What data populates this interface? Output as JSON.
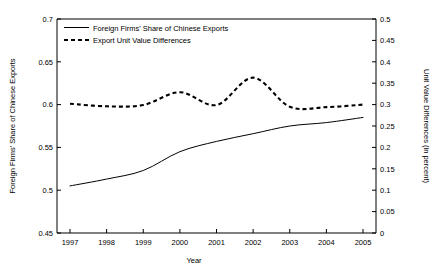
{
  "chart_data": {
    "type": "line",
    "title": "",
    "xlabel": "Year",
    "ylabel": "Foreign Firms' Share of Chinese Exports",
    "y2label": "Unit Value Differences (in percent)",
    "categories": [
      "1997",
      "1998",
      "1999",
      "2000",
      "2001",
      "2002",
      "2003",
      "2004",
      "2005"
    ],
    "x": [
      1997,
      1998,
      1999,
      2000,
      2001,
      2002,
      2003,
      2004,
      2005
    ],
    "ylim": [
      0.45,
      0.7
    ],
    "y2lim": [
      0,
      0.5
    ],
    "yticks": [
      "0.45",
      "0.5",
      "0.55",
      "0.6",
      "0.65",
      "0.7"
    ],
    "ytick_values": [
      0.45,
      0.5,
      0.55,
      0.6,
      0.65,
      0.7
    ],
    "y2ticks": [
      "0",
      "0.05",
      "0.1",
      "0.15",
      "0.2",
      "0.25",
      "0.3",
      "0.35",
      "0.4",
      "0.45",
      "0.5"
    ],
    "y2tick_values": [
      0,
      0.05,
      0.1,
      0.15,
      0.2,
      0.25,
      0.3,
      0.35,
      0.4,
      0.45,
      0.5
    ],
    "grid": false,
    "legend_position": "top-left",
    "series": [
      {
        "name": "Foreign Firms' Share of Chinese Exports",
        "axis": "left",
        "style": "solid",
        "values": [
          0.505,
          0.513,
          0.523,
          0.545,
          0.557,
          0.566,
          0.575,
          0.579,
          0.585
        ]
      },
      {
        "name": "Export Unit Value Differences",
        "axis": "right",
        "style": "dashed",
        "values": [
          0.302,
          0.296,
          0.299,
          0.329,
          0.299,
          0.363,
          0.295,
          0.294,
          0.3
        ]
      }
    ]
  },
  "legend": {
    "items": [
      {
        "label": "Foreign Firms' Share of Chinese Exports",
        "style": "solid"
      },
      {
        "label": "Export Unit Value Differences",
        "style": "dashed"
      }
    ]
  }
}
